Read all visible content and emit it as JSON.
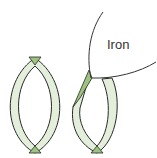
{
  "diagram": {
    "labels": {
      "iron": "Iron"
    },
    "colors": {
      "ring_fill": "#e3eedb",
      "ring_stroke": "#2a2a2a",
      "wedge_fill": "#9cc47e",
      "iron_stroke": "#333333",
      "background": "#ffffff"
    },
    "elements": [
      {
        "name": "undeformed-ring",
        "description": "Closed ring with green wedge at top and bottom"
      },
      {
        "name": "deformed-ring",
        "description": "Ring pressed open by iron surface, green wedge at upper-left contact and bottom"
      },
      {
        "name": "iron-surface",
        "description": "Curved iron boundary contacting right ring"
      }
    ]
  }
}
